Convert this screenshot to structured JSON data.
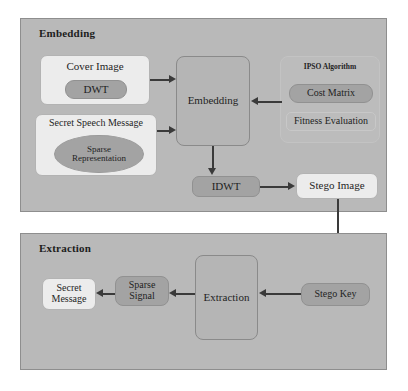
{
  "diagram": {
    "colors": {
      "panel_fill": "#b9b9b9",
      "panel_border": "#8e8e8e",
      "light_node_fill": "#ececec",
      "mid_node_fill": "#b5b5b5",
      "dark_node_fill": "#a3a3a3",
      "arrow": "#3a3a3a",
      "text": "#1f1f1f"
    }
  },
  "embedding_section": {
    "title": "Embedding",
    "cover_image": {
      "label": "Cover Image",
      "inner_label": "DWT"
    },
    "secret_speech": {
      "label": "Secret Speech Message",
      "inner_label_line1": "Sparse",
      "inner_label_line2": "Representation"
    },
    "embedding_block": {
      "label": "Embedding"
    },
    "ipso": {
      "title": "IPSO Algorithm",
      "items": [
        {
          "label": "Cost Matrix"
        },
        {
          "label": "Fitness Evaluation"
        }
      ]
    },
    "idwt": {
      "label": "IDWT"
    },
    "stego_image": {
      "label": "Stego Image"
    }
  },
  "extraction_section": {
    "title": "Extraction",
    "secret_message": {
      "line1": "Secret",
      "line2": "Message"
    },
    "sparse_signal": {
      "line1": "Sparse",
      "line2": "Signal"
    },
    "extraction_block": {
      "label": "Extraction"
    },
    "stego_key": {
      "label": "Stego Key"
    }
  },
  "connections": [
    {
      "from": "cover-image",
      "to": "embedding-block",
      "direction": "right"
    },
    {
      "from": "secret-speech-message",
      "to": "embedding-block",
      "direction": "right"
    },
    {
      "from": "ipso-algorithm",
      "to": "embedding-block",
      "direction": "left"
    },
    {
      "from": "embedding-block",
      "to": "idwt",
      "direction": "down"
    },
    {
      "from": "idwt",
      "to": "stego-image",
      "direction": "right"
    },
    {
      "from": "stego-image",
      "to": "stego-key",
      "direction": "down"
    },
    {
      "from": "stego-key",
      "to": "extraction-block",
      "direction": "left"
    },
    {
      "from": "extraction-block",
      "to": "sparse-signal",
      "direction": "left"
    },
    {
      "from": "sparse-signal",
      "to": "secret-message",
      "direction": "left"
    }
  ]
}
